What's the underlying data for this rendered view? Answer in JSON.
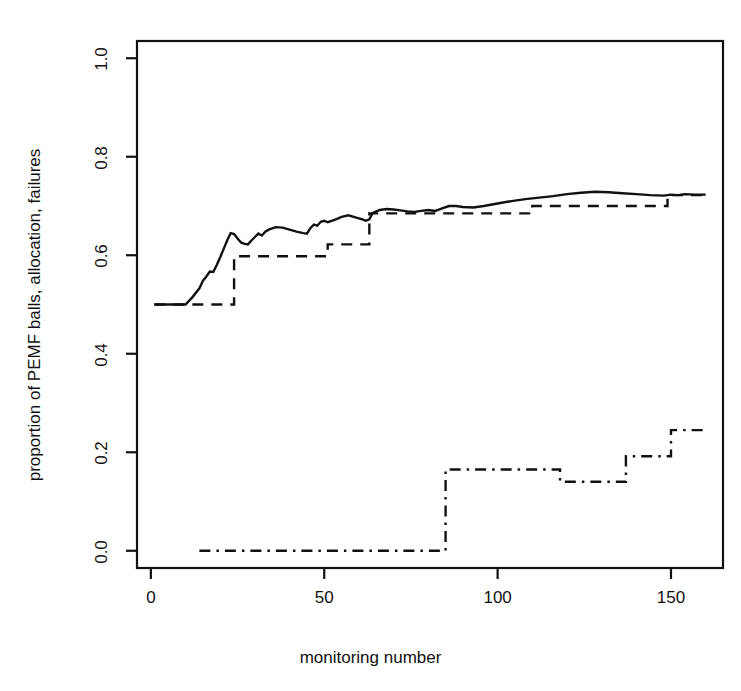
{
  "chart_data": {
    "type": "line",
    "title": "",
    "xlabel": "monitoring number",
    "ylabel": "proportion of PEMF balls, allocation, failures",
    "xlim": [
      -4,
      165
    ],
    "ylim": [
      -0.035,
      1.035
    ],
    "xticks": [
      0,
      50,
      100,
      150
    ],
    "xtick_labels": [
      "0",
      "50",
      "100",
      "150"
    ],
    "yticks": [
      0.0,
      0.2,
      0.4,
      0.6,
      0.8,
      1.0
    ],
    "ytick_labels": [
      "0.0",
      "0.2",
      "0.4",
      "0.6",
      "0.8",
      "1.0"
    ],
    "grid": false,
    "legend": "none",
    "box": true,
    "series": [
      {
        "name": "PEMF balls",
        "style": "solid",
        "color": "#111111",
        "points": [
          [
            1,
            0.5
          ],
          [
            10,
            0.5
          ],
          [
            12,
            0.515
          ],
          [
            14,
            0.533
          ],
          [
            15,
            0.548
          ],
          [
            16,
            0.557
          ],
          [
            17,
            0.567
          ],
          [
            18,
            0.566
          ],
          [
            19,
            0.58
          ],
          [
            20,
            0.596
          ],
          [
            21,
            0.613
          ],
          [
            22,
            0.63
          ],
          [
            23,
            0.645
          ],
          [
            24,
            0.643
          ],
          [
            25,
            0.634
          ],
          [
            26,
            0.626
          ],
          [
            27,
            0.623
          ],
          [
            28,
            0.622
          ],
          [
            29,
            0.63
          ],
          [
            30,
            0.637
          ],
          [
            31,
            0.644
          ],
          [
            32,
            0.64
          ],
          [
            33,
            0.648
          ],
          [
            34,
            0.652
          ],
          [
            36,
            0.657
          ],
          [
            38,
            0.656
          ],
          [
            40,
            0.652
          ],
          [
            42,
            0.648
          ],
          [
            44,
            0.645
          ],
          [
            45,
            0.644
          ],
          [
            46,
            0.655
          ],
          [
            47,
            0.662
          ],
          [
            48,
            0.66
          ],
          [
            49,
            0.668
          ],
          [
            50,
            0.67
          ],
          [
            51,
            0.667
          ],
          [
            53,
            0.672
          ],
          [
            55,
            0.678
          ],
          [
            57,
            0.681
          ],
          [
            59,
            0.677
          ],
          [
            61,
            0.673
          ],
          [
            62,
            0.67
          ],
          [
            63,
            0.673
          ],
          [
            64,
            0.686
          ],
          [
            66,
            0.692
          ],
          [
            68,
            0.694
          ],
          [
            70,
            0.693
          ],
          [
            72,
            0.691
          ],
          [
            74,
            0.689
          ],
          [
            76,
            0.688
          ],
          [
            78,
            0.69
          ],
          [
            80,
            0.692
          ],
          [
            82,
            0.69
          ],
          [
            84,
            0.695
          ],
          [
            86,
            0.7
          ],
          [
            88,
            0.7
          ],
          [
            90,
            0.698
          ],
          [
            93,
            0.697
          ],
          [
            96,
            0.7
          ],
          [
            100,
            0.705
          ],
          [
            104,
            0.71
          ],
          [
            108,
            0.714
          ],
          [
            112,
            0.717
          ],
          [
            116,
            0.72
          ],
          [
            120,
            0.724
          ],
          [
            124,
            0.727
          ],
          [
            128,
            0.729
          ],
          [
            132,
            0.728
          ],
          [
            136,
            0.726
          ],
          [
            140,
            0.724
          ],
          [
            144,
            0.722
          ],
          [
            148,
            0.721
          ],
          [
            150,
            0.723
          ],
          [
            152,
            0.722
          ],
          [
            154,
            0.724
          ],
          [
            157,
            0.723
          ],
          [
            160,
            0.723
          ]
        ]
      },
      {
        "name": "allocation",
        "style": "dashed",
        "color": "#111111",
        "step": true,
        "points": [
          [
            1,
            0.5
          ],
          [
            24,
            0.5
          ],
          [
            24,
            0.598
          ],
          [
            51,
            0.598
          ],
          [
            51,
            0.622
          ],
          [
            63,
            0.622
          ],
          [
            63,
            0.685
          ],
          [
            110,
            0.685
          ],
          [
            110,
            0.7
          ],
          [
            149,
            0.7
          ],
          [
            149,
            0.722
          ],
          [
            160,
            0.722
          ]
        ]
      },
      {
        "name": "failures",
        "style": "dashdot",
        "color": "#111111",
        "step": true,
        "points": [
          [
            14,
            0.0
          ],
          [
            85,
            0.0
          ],
          [
            85,
            0.165
          ],
          [
            118,
            0.165
          ],
          [
            118,
            0.14
          ],
          [
            137,
            0.14
          ],
          [
            137,
            0.192
          ],
          [
            150,
            0.192
          ],
          [
            150,
            0.245
          ],
          [
            160,
            0.245
          ]
        ]
      }
    ]
  },
  "axes": {
    "plot_box": {
      "left": 137,
      "top": 41,
      "right": 723,
      "bottom": 568
    }
  }
}
